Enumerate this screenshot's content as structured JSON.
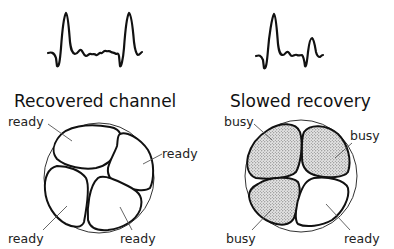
{
  "panels": [
    {
      "id": "recovered",
      "title": "Recovered channel",
      "waveform": "two-full-spikes",
      "cells": [
        {
          "position": "top-left",
          "state": "ready",
          "label": "ready"
        },
        {
          "position": "right",
          "state": "ready",
          "label": "ready"
        },
        {
          "position": "bottom-left",
          "state": "ready",
          "label": "ready"
        },
        {
          "position": "bottom-right",
          "state": "ready",
          "label": "ready"
        }
      ]
    },
    {
      "id": "slowed",
      "title": "Slowed recovery",
      "waveform": "full-spike-then-reduced-spike",
      "cells": [
        {
          "position": "top-left",
          "state": "busy",
          "label": "busy"
        },
        {
          "position": "top-right",
          "state": "busy",
          "label": "busy"
        },
        {
          "position": "bottom-left",
          "state": "busy",
          "label": "busy"
        },
        {
          "position": "bottom-right",
          "state": "ready",
          "label": "ready"
        }
      ]
    }
  ],
  "colors": {
    "ink": "#111111",
    "stipple": "#555555",
    "background": "#ffffff"
  }
}
